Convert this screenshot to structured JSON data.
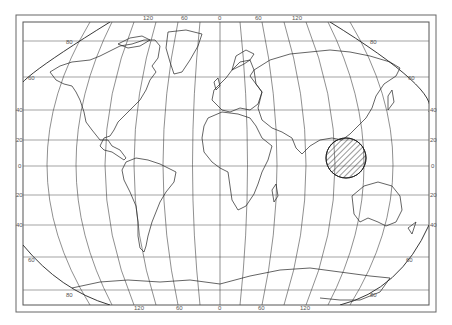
{
  "map": {
    "type": "world outline map, pseudocylindrical projection",
    "colors": {
      "background": "#ffffff",
      "line": "#333333",
      "grid": "#555555",
      "frame": "#555555",
      "hatch": "#333333"
    },
    "meridian_labels_top": [
      "120",
      "60",
      "0",
      "60",
      "120"
    ],
    "meridian_labels_bottom": [
      "120",
      "60",
      "0",
      "60",
      "120"
    ],
    "parallel_labels_left": [
      "40",
      "20",
      "0",
      "20",
      "40"
    ],
    "parallel_labels_right": [
      "40",
      "20",
      "0",
      "20",
      "40"
    ],
    "edge_labels": {
      "top_left_80": "80",
      "top_left_60": "60",
      "top_right_80": "80",
      "top_right_60": "60",
      "bottom_left_60": "60",
      "bottom_left_80": "80",
      "bottom_right_60": "60",
      "bottom_right_80": "80"
    },
    "highlighted_region": {
      "name": "Southeast Asia / Indonesia",
      "style": "diagonal hatching inside circle"
    }
  }
}
